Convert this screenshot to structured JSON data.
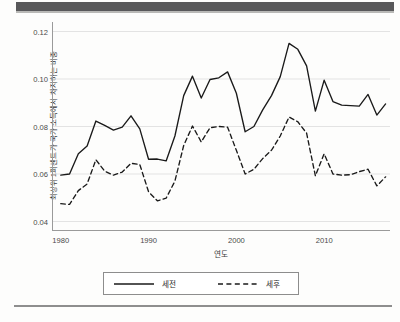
{
  "page": {
    "page_number": ""
  },
  "chart_data": {
    "type": "line",
    "title": "",
    "xlabel": "연도",
    "ylabel": "최상위 1퍼센트가 국가 소득에서 차지하는 비중",
    "xlim": [
      1979,
      2017.5
    ],
    "ylim": [
      0.036,
      0.124
    ],
    "grid": true,
    "grid_axis": "y",
    "legend_position": "bottom",
    "x_ticks": [
      "1980",
      "1990",
      "2000",
      "2010"
    ],
    "x_tick_values": [
      1980,
      1990,
      2000,
      2010
    ],
    "y_ticks": [
      "0.04",
      "0.06",
      "0.08",
      "0.10",
      "0.12"
    ],
    "y_tick_values": [
      0.04,
      0.06,
      0.08,
      0.1,
      0.12
    ],
    "x": [
      1980,
      1981,
      1982,
      1983,
      1984,
      1985,
      1986,
      1987,
      1988,
      1989,
      1990,
      1991,
      1992,
      1993,
      1994,
      1995,
      1996,
      1997,
      1998,
      1999,
      2000,
      2001,
      2002,
      2003,
      2004,
      2005,
      2006,
      2007,
      2008,
      2009,
      2010,
      2011,
      2012,
      2013,
      2014,
      2015,
      2016,
      2017
    ],
    "series": [
      {
        "name": "세전",
        "style": "solid",
        "color": "#1a1a1a",
        "values": [
          0.0595,
          0.06,
          0.0685,
          0.0718,
          0.0823,
          0.0805,
          0.0785,
          0.0797,
          0.0845,
          0.079,
          0.0662,
          0.0663,
          0.0655,
          0.076,
          0.093,
          0.1012,
          0.092,
          0.0998,
          0.1005,
          0.103,
          0.094,
          0.0778,
          0.08,
          0.087,
          0.093,
          0.101,
          0.115,
          0.1125,
          0.1055,
          0.0865,
          0.0995,
          0.0905,
          0.089,
          0.0888,
          0.0886,
          0.0935,
          0.0848,
          0.0895
        ]
      },
      {
        "name": "세후",
        "style": "dashed",
        "color": "#1a1a1a",
        "values": [
          0.0475,
          0.0472,
          0.053,
          0.0558,
          0.066,
          0.0612,
          0.0595,
          0.0608,
          0.0645,
          0.064,
          0.0525,
          0.0487,
          0.0498,
          0.057,
          0.072,
          0.0802,
          0.0735,
          0.0795,
          0.08,
          0.0797,
          0.07,
          0.06,
          0.062,
          0.0665,
          0.07,
          0.076,
          0.084,
          0.082,
          0.0772,
          0.0592,
          0.0685,
          0.06,
          0.0595,
          0.0597,
          0.061,
          0.062,
          0.055,
          0.0588
        ]
      }
    ]
  },
  "legend": {
    "items": [
      {
        "label": "세전",
        "style": "solid"
      },
      {
        "label": "세후",
        "style": "dashed"
      }
    ]
  }
}
